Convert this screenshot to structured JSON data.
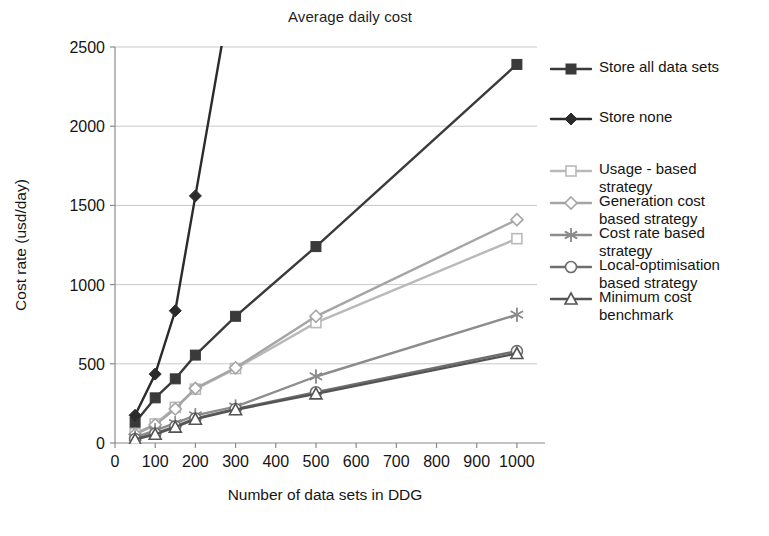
{
  "chart_data": {
    "type": "line",
    "title": "Average daily cost",
    "xlabel": "Number of data sets in DDG",
    "ylabel": "Cost rate (usd/day)",
    "xlim": [
      0,
      1050
    ],
    "ylim": [
      0,
      2500
    ],
    "xticks": [
      0,
      100,
      200,
      300,
      400,
      500,
      600,
      700,
      800,
      900,
      1000
    ],
    "xticklabels": [
      "0",
      "100",
      "200",
      "300",
      "400",
      "500",
      "600",
      "700",
      "800",
      "900",
      "1000"
    ],
    "yticks": [
      0,
      500,
      1000,
      1500,
      2000,
      2500
    ],
    "yticklabels": [
      "0",
      "500",
      "1000",
      "1500",
      "2000",
      "2500"
    ],
    "grid": "horizontal",
    "legend_position": "right-outside",
    "x": [
      50,
      100,
      150,
      200,
      300,
      500,
      1000
    ],
    "series": [
      {
        "name": "Store all data sets",
        "marker": "filled-square",
        "color": "#3a3a3a",
        "values": [
          130,
          285,
          405,
          555,
          800,
          1240,
          2390
        ]
      },
      {
        "name": "Store none",
        "marker": "filled-diamond",
        "color": "#2b2b2b",
        "values": [
          175,
          435,
          835,
          1560,
          null,
          null,
          null
        ]
      },
      {
        "name": "Usage - based\nstrategy",
        "marker": "open-square",
        "color": "#b9b9b9",
        "values": [
          60,
          120,
          225,
          340,
          470,
          760,
          1290
        ]
      },
      {
        "name": "Generation cost\nbased strategy",
        "marker": "open-diamond",
        "color": "#a5a5a5",
        "values": [
          55,
          115,
          215,
          345,
          475,
          800,
          1410
        ]
      },
      {
        "name": "Cost rate based\nstrategy",
        "marker": "asterisk",
        "color": "#8c8c8c",
        "values": [
          35,
          80,
          125,
          175,
          230,
          420,
          810
        ]
      },
      {
        "name": "Local-optimisation\nbased strategy",
        "marker": "open-circle",
        "color": "#6e6e6e",
        "values": [
          25,
          60,
          105,
          155,
          215,
          320,
          580
        ]
      },
      {
        "name": "Minimum cost\nbenchmark",
        "marker": "open-triangle",
        "color": "#545454",
        "values": [
          22,
          55,
          100,
          150,
          210,
          310,
          565
        ]
      }
    ]
  },
  "legend": {
    "items": [
      {
        "label": "Store all data sets",
        "marker": "filled-square",
        "color": "#3a3a3a"
      },
      {
        "label": "Store none",
        "marker": "filled-diamond",
        "color": "#2b2b2b"
      },
      {
        "label": "Usage - based\nstrategy",
        "marker": "open-square",
        "color": "#b9b9b9"
      },
      {
        "label": "Generation cost\nbased strategy",
        "marker": "open-diamond",
        "color": "#a5a5a5"
      },
      {
        "label": "Cost rate based\nstrategy",
        "marker": "asterisk",
        "color": "#8c8c8c"
      },
      {
        "label": "Local-optimisation\nbased strategy",
        "marker": "open-circle",
        "color": "#6e6e6e"
      },
      {
        "label": "Minimum cost\nbenchmark",
        "marker": "open-triangle",
        "color": "#545454"
      }
    ]
  },
  "colors": {
    "axis": "#8a8a8a",
    "grid": "#c8c8c8",
    "text": "#141414",
    "background": "#ffffff"
  }
}
